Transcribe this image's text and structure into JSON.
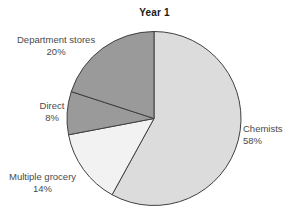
{
  "chart_data": {
    "type": "pie",
    "title": "Year 1",
    "xlabel": "",
    "ylabel": "",
    "legend_position": "none",
    "grid": false,
    "start_angle_deg": 0,
    "direction": "clockwise",
    "categories": [
      "Chemists",
      "Multiple grocery",
      "Direct",
      "Department stores"
    ],
    "values": [
      58,
      14,
      8,
      20
    ],
    "value_unit": "%",
    "slices": [
      {
        "name": "Chemists",
        "value": 58,
        "label_name": "Chemists",
        "label_value": "58%",
        "color": "#dcdcdc",
        "start_deg": 0,
        "end_deg": 208.8
      },
      {
        "name": "Multiple grocery",
        "value": 14,
        "label_name": "Multiple grocery",
        "label_value": "14%",
        "color": "#f2f2f2",
        "start_deg": 208.8,
        "end_deg": 259.2
      },
      {
        "name": "Direct",
        "value": 8,
        "label_name": "Direct",
        "label_value": "8%",
        "color": "#9a9a9a",
        "start_deg": 259.2,
        "end_deg": 288.0
      },
      {
        "name": "Department stores",
        "value": 20,
        "label_name": "Department stores",
        "label_value": "20%",
        "color": "#9a9a9a",
        "start_deg": 288.0,
        "end_deg": 360.0
      }
    ],
    "stroke_color": "#404040",
    "text_color": "#4a4a4a",
    "background": "#ffffff"
  }
}
